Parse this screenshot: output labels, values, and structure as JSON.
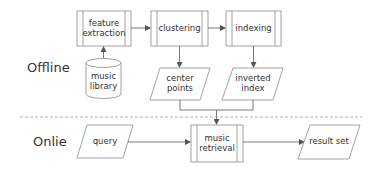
{
  "sections": {
    "offline": "Offline",
    "online": "Onlie"
  },
  "nodes": {
    "feature_extraction": "feature extraction",
    "clustering": "clustering",
    "indexing": "indexing",
    "music_library": "music library",
    "center_points": "center points",
    "inverted_index": "inverted index",
    "query": "query",
    "music_retrieval": "music retrieval",
    "result_set": "result set"
  },
  "colors": {
    "stroke": "#8a8a8a",
    "arrow": "#555555",
    "divider": "#9a9a9a",
    "text": "#333333"
  }
}
